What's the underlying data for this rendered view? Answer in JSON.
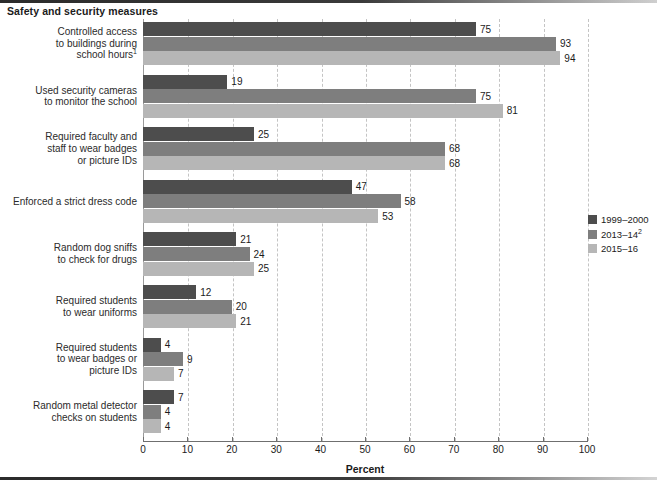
{
  "title": "Safety and security measures",
  "axis_title": "Percent",
  "legend": {
    "items": [
      {
        "label": "1999–2000",
        "sup": "",
        "color": "#4d4d4d"
      },
      {
        "label": "2013–14",
        "sup": "2",
        "color": "#7e7e7e"
      },
      {
        "label": "2015–16",
        "sup": "",
        "color": "#b6b6b6"
      }
    ]
  },
  "chart_data": {
    "type": "bar",
    "orientation": "horizontal",
    "title": "Safety and security measures",
    "xlabel": "Percent",
    "ylabel": "",
    "xlim": [
      0,
      100
    ],
    "xticks": [
      0,
      10,
      20,
      30,
      40,
      50,
      60,
      70,
      80,
      90,
      100
    ],
    "xticklabels": [
      "0",
      "10",
      "20",
      "30",
      "40",
      "50",
      "60",
      "70",
      "80",
      "90",
      "100"
    ],
    "grid": true,
    "legend_position": "right",
    "categories": [
      {
        "lines": [
          "Controlled access",
          "to buildings during",
          "school hours"
        ],
        "sup": "1"
      },
      {
        "lines": [
          "Used security cameras",
          "to monitor the school"
        ],
        "sup": ""
      },
      {
        "lines": [
          "Required faculty and",
          "staff to wear badges",
          "or picture IDs"
        ],
        "sup": ""
      },
      {
        "lines": [
          "Enforced a strict dress code"
        ],
        "sup": ""
      },
      {
        "lines": [
          "Random dog sniffs",
          "to check for drugs"
        ],
        "sup": ""
      },
      {
        "lines": [
          "Required students",
          "to wear uniforms"
        ],
        "sup": ""
      },
      {
        "lines": [
          "Required students",
          "to wear badges or",
          "picture IDs"
        ],
        "sup": ""
      },
      {
        "lines": [
          "Random metal detector",
          "checks on students"
        ],
        "sup": ""
      }
    ],
    "series": [
      {
        "name": "1999–2000",
        "color": "#4d4d4d",
        "values": [
          75,
          19,
          25,
          47,
          21,
          12,
          4,
          7
        ]
      },
      {
        "name": "2013–14",
        "color": "#7e7e7e",
        "values": [
          93,
          75,
          68,
          58,
          24,
          20,
          9,
          4
        ]
      },
      {
        "name": "2015–16",
        "color": "#b6b6b6",
        "values": [
          94,
          81,
          68,
          53,
          25,
          21,
          7,
          4
        ]
      }
    ]
  }
}
